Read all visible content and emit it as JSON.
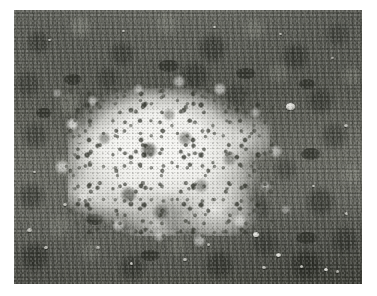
{
  "page": {
    "background_color": "#ffffff",
    "width": 377,
    "height": 296
  },
  "photo": {
    "name": "ground-photograph",
    "alt_text": "Patch of white granular material scattered on grassy ground",
    "frame": {
      "left": 14,
      "top": 10,
      "width": 348,
      "height": 274
    },
    "palette": {
      "turf_mid": "#76776f",
      "turf_dark": "#4a4c44",
      "turf_light": "#9a9b92",
      "patch_white": "#f6f6f4",
      "patch_edge": "#dededa",
      "pebble_light": "#e8e8e4",
      "shadow": "#2a2c26"
    },
    "subject": {
      "label": "white granular patch",
      "center_x": 169,
      "center_y": 162,
      "width": 202,
      "height": 148
    },
    "pebbles": [
      {
        "x": 286,
        "y": 103,
        "w": 9,
        "h": 7,
        "dim": false
      },
      {
        "x": 344,
        "y": 124,
        "w": 4,
        "h": 3,
        "dim": true
      },
      {
        "x": 253,
        "y": 232,
        "w": 6,
        "h": 5,
        "dim": false
      },
      {
        "x": 276,
        "y": 253,
        "w": 5,
        "h": 4,
        "dim": false
      },
      {
        "x": 262,
        "y": 266,
        "w": 4,
        "h": 3,
        "dim": true
      },
      {
        "x": 300,
        "y": 265,
        "w": 3,
        "h": 3,
        "dim": true
      },
      {
        "x": 324,
        "y": 268,
        "w": 4,
        "h": 3,
        "dim": false
      },
      {
        "x": 336,
        "y": 270,
        "w": 3,
        "h": 3,
        "dim": true
      },
      {
        "x": 27,
        "y": 228,
        "w": 5,
        "h": 4,
        "dim": true
      },
      {
        "x": 44,
        "y": 246,
        "w": 4,
        "h": 3,
        "dim": true
      },
      {
        "x": 63,
        "y": 203,
        "w": 4,
        "h": 3,
        "dim": true
      },
      {
        "x": 96,
        "y": 246,
        "w": 4,
        "h": 3,
        "dim": true
      },
      {
        "x": 130,
        "y": 262,
        "w": 3,
        "h": 3,
        "dim": true
      },
      {
        "x": 183,
        "y": 258,
        "w": 4,
        "h": 3,
        "dim": true
      },
      {
        "x": 207,
        "y": 243,
        "w": 3,
        "h": 3,
        "dim": true
      },
      {
        "x": 48,
        "y": 39,
        "w": 3,
        "h": 2,
        "dim": true
      },
      {
        "x": 122,
        "y": 30,
        "w": 3,
        "h": 2,
        "dim": true
      },
      {
        "x": 213,
        "y": 26,
        "w": 3,
        "h": 2,
        "dim": true
      },
      {
        "x": 279,
        "y": 33,
        "w": 3,
        "h": 2,
        "dim": true
      },
      {
        "x": 331,
        "y": 57,
        "w": 3,
        "h": 2,
        "dim": true
      },
      {
        "x": 78,
        "y": 141,
        "w": 3,
        "h": 2,
        "dim": true
      },
      {
        "x": 33,
        "y": 171,
        "w": 3,
        "h": 2,
        "dim": true
      },
      {
        "x": 312,
        "y": 185,
        "w": 3,
        "h": 2,
        "dim": true
      },
      {
        "x": 345,
        "y": 212,
        "w": 3,
        "h": 3,
        "dim": true
      }
    ],
    "clods": [
      {
        "x": 64,
        "y": 74,
        "w": 18,
        "h": 11
      },
      {
        "x": 158,
        "y": 60,
        "w": 22,
        "h": 12
      },
      {
        "x": 236,
        "y": 68,
        "w": 20,
        "h": 11
      },
      {
        "x": 299,
        "y": 79,
        "w": 17,
        "h": 10
      },
      {
        "x": 36,
        "y": 108,
        "w": 16,
        "h": 10
      },
      {
        "x": 301,
        "y": 148,
        "w": 20,
        "h": 12
      },
      {
        "x": 86,
        "y": 214,
        "w": 18,
        "h": 11
      },
      {
        "x": 222,
        "y": 207,
        "w": 17,
        "h": 10
      },
      {
        "x": 296,
        "y": 232,
        "w": 22,
        "h": 12
      },
      {
        "x": 140,
        "y": 250,
        "w": 20,
        "h": 11
      }
    ]
  }
}
